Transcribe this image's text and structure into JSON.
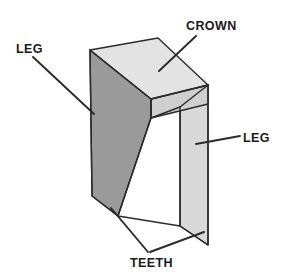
{
  "figure": {
    "kind": "staple-anatomy-diagram",
    "background_color": "#ffffff",
    "outline_color": "#2b2b2b",
    "leader_color": "#2b2b2b"
  },
  "parts": {
    "crown": {
      "label": "CROWN",
      "top_face_color": "#e3e3e3",
      "front_edge_color": "#cfcfcf"
    },
    "left_leg": {
      "label": "LEG",
      "face_color": "#9a9a9a",
      "edge_color": "#8e8e8e"
    },
    "right_leg": {
      "label": "LEG",
      "face_color": "#d9d9d9",
      "edge_color": "#c6c6c6"
    },
    "teeth": {
      "label": "TEETH"
    },
    "inner_opening": {
      "label": "inner-opening",
      "fill_color": "#ffffff"
    }
  },
  "callouts": [
    {
      "name": "crown-callout",
      "label": "CROWN",
      "text_x": 186,
      "text_y": 30,
      "anchor": "start"
    },
    {
      "name": "left-leg-callout",
      "label": "LEG",
      "text_x": 16,
      "text_y": 53,
      "anchor": "start"
    },
    {
      "name": "right-leg-callout",
      "label": "LEG",
      "text_x": 243,
      "text_y": 142,
      "anchor": "start"
    },
    {
      "name": "teeth-callout",
      "label": "TEETH",
      "text_x": 130,
      "text_y": 267,
      "anchor": "start"
    }
  ],
  "geometry": {
    "crown_top_face": "90,50 158,38 208,85 151,99",
    "crown_front_face": "151,99 208,85 208,104 151,118",
    "left_leg_face": "90,50 151,99 151,118 118,216 92,196",
    "right_leg_face": "208,85 208,245 180,226 180,107",
    "inner_opening": "151,118 180,107 180,226 118,216",
    "crown_underside": "151,99 208,85 208,104 180,107 180,107 151,118"
  },
  "leaders": {
    "crown": {
      "x1": 196,
      "y1": 36,
      "x2": 159,
      "y2": 71
    },
    "left_leg": {
      "x1": 33,
      "y1": 57,
      "x2": 94,
      "y2": 114
    },
    "right_leg": {
      "x1": 240,
      "y1": 136,
      "x2": 196,
      "y2": 144
    },
    "teeth_left": {
      "x1": 148,
      "y1": 252,
      "x2": 111,
      "y2": 208
    },
    "teeth_right": {
      "x1": 150,
      "y1": 252,
      "x2": 204,
      "y2": 232
    }
  }
}
